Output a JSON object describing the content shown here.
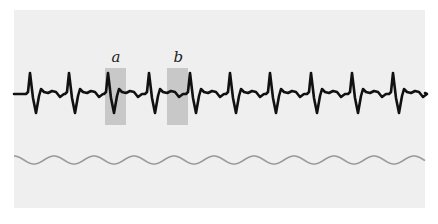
{
  "figure": {
    "background": "#ffffff",
    "panel_color": "#efefef",
    "trace_color": "#111111",
    "reference_wave_color": "#999999",
    "highlight_color": "#c8c8c8"
  },
  "ecg_trace": {
    "beat_peaks_x": [
      30,
      69,
      108,
      149,
      190,
      230,
      270,
      311,
      352,
      393
    ],
    "baseline_y": 94,
    "peak_y": 73,
    "trough_y": 113
  },
  "highlights": [
    {
      "label": "a",
      "x": 105,
      "width": 21,
      "y": 68,
      "height": 57
    },
    {
      "label": "b",
      "x": 167,
      "width": 21,
      "y": 68,
      "height": 57
    }
  ],
  "reference_wave": {
    "y_center": 160,
    "amplitude": 4,
    "period": 40,
    "x_start": 14,
    "x_end": 425
  }
}
